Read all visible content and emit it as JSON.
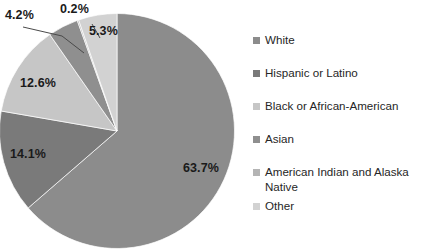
{
  "chart_data": {
    "type": "pie",
    "title": "",
    "subtitle": "",
    "xlabel": "",
    "ylabel": "",
    "legend_position": "right",
    "grid": false,
    "start_angle_deg": 0,
    "direction": "clockwise",
    "categories": [
      "White",
      "Hispanic or Latino",
      "Black or African-American",
      "Asian",
      "American Indian and Alaska Native",
      "Other"
    ],
    "values": [
      63.7,
      14.1,
      12.6,
      4.2,
      0.2,
      5.3
    ],
    "value_labels": [
      "63.7%",
      "14.1%",
      "12.6%",
      "4.2%",
      "0.2%",
      "5.3%"
    ],
    "colors": [
      "#8c8c8c",
      "#7a7a7a",
      "#c6c6c6",
      "#8f8f8f",
      "#b4b4b4",
      "#d2d2d2"
    ],
    "units": "percent",
    "slices": [
      {
        "label": "White",
        "value": 63.7,
        "display": "63.7%",
        "color": "#8c8c8c",
        "leader_line": false
      },
      {
        "label": "Hispanic or Latino",
        "value": 14.1,
        "display": "14.1%",
        "color": "#7a7a7a",
        "leader_line": false
      },
      {
        "label": "Black or African-American",
        "value": 12.6,
        "display": "12.6%",
        "color": "#c6c6c6",
        "leader_line": false
      },
      {
        "label": "Asian",
        "value": 4.2,
        "display": "4.2%",
        "color": "#8f8f8f",
        "leader_line": true
      },
      {
        "label": "American Indian and Alaska Native",
        "value": 0.2,
        "display": "0.2%",
        "color": "#b4b4b4",
        "leader_line": true
      },
      {
        "label": "Other",
        "value": 5.3,
        "display": "5.3%",
        "color": "#d2d2d2",
        "leader_line": false
      }
    ]
  },
  "pie": {
    "labels": {
      "white": "63.7%",
      "hispanic": "14.1%",
      "black": "12.6%",
      "asian": "4.2%",
      "american_indian": "0.2%",
      "other": "5.3%"
    }
  },
  "legend": {
    "items": [
      {
        "label": "White",
        "color": "#8c8c8c"
      },
      {
        "label": "Hispanic or Latino",
        "color": "#7a7a7a"
      },
      {
        "label": "Black or African-American",
        "color": "#c6c6c6"
      },
      {
        "label": "Asian",
        "color": "#8f8f8f"
      },
      {
        "label": "American Indian and Alaska Native",
        "color": "#b4b4b4"
      },
      {
        "label": "Other",
        "color": "#d2d2d2"
      }
    ]
  }
}
